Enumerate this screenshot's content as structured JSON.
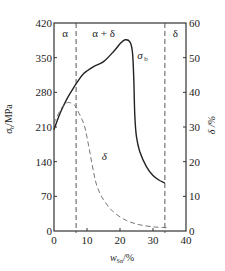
{
  "chart_data": {
    "type": "line",
    "title": "",
    "xlabel": "w_Sn/%",
    "xlabel_main": "w",
    "xlabel_sub": "Sn",
    "xlabel_unit": "/%",
    "ylabel_left": "σ_b/MPa",
    "ylabel_left_main": "σ",
    "ylabel_left_sub": "b",
    "ylabel_left_unit": "/MPa",
    "ylabel_right": "δ /%",
    "xlim": [
      0,
      40
    ],
    "ylim_left": [
      0,
      420
    ],
    "ylim_right": [
      0,
      60
    ],
    "x_ticks": [
      "0",
      "10",
      "20",
      "30",
      "40"
    ],
    "y_left_ticks": [
      "0",
      "70",
      "140",
      "210",
      "280",
      "350",
      "420"
    ],
    "y_right_ticks": [
      "0",
      "10",
      "20",
      "30",
      "40",
      "50",
      "60"
    ],
    "grid": false,
    "legend": "none (curves labeled inline)",
    "phase_boundaries": [
      6.7,
      33.6
    ],
    "regions": [
      "α",
      "α + δ",
      "δ"
    ],
    "series": [
      {
        "name": "σ_b",
        "label": "σ",
        "label_sub": "b",
        "axis": "left",
        "style": "solid",
        "x": [
          0,
          2,
          4,
          6,
          7,
          9,
          12,
          15,
          18,
          20,
          21.5,
          23,
          23.8,
          24.2,
          24.5,
          25,
          26,
          28,
          30,
          32,
          33.6
        ],
        "y": [
          205,
          240,
          268,
          290,
          300,
          318,
          332,
          342,
          362,
          378,
          386,
          382,
          360,
          300,
          230,
          190,
          160,
          130,
          112,
          102,
          97
        ]
      },
      {
        "name": "δ",
        "label": "δ",
        "axis": "right",
        "style": "dashed",
        "x": [
          0,
          2,
          4,
          6,
          7,
          9,
          10,
          11,
          12,
          13,
          15,
          18,
          22,
          26,
          30,
          33,
          35
        ],
        "y": [
          31,
          35,
          37,
          36.5,
          35,
          31,
          27,
          22,
          17,
          13,
          9,
          5.5,
          3,
          1.8,
          1.2,
          1,
          0.9
        ]
      }
    ]
  }
}
